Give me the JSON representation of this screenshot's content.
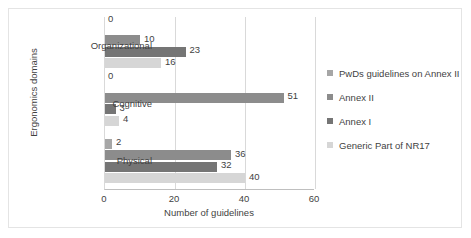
{
  "chart_data": {
    "type": "bar",
    "orientation": "horizontal",
    "title": "",
    "xlabel": "Number of guidelines",
    "ylabel": "Ergonomics domains",
    "xlim": [
      0,
      60
    ],
    "xticks": [
      0,
      20,
      40,
      60
    ],
    "grid": true,
    "legend_position": "right",
    "categories": [
      "Organizational",
      "Cognitive",
      "Physical"
    ],
    "series": [
      {
        "name": "PwDs guidelines on Annex II",
        "color": "#a6a6a6",
        "values": [
          0,
          0,
          2
        ]
      },
      {
        "name": "Annex II",
        "color": "#8c8c8c",
        "values": [
          10,
          51,
          36
        ]
      },
      {
        "name": "Annex I",
        "color": "#757575",
        "values": [
          23,
          3,
          32
        ]
      },
      {
        "name": "Generic Part of NR17",
        "color": "#d6d6d6",
        "values": [
          16,
          4,
          40
        ]
      }
    ]
  }
}
